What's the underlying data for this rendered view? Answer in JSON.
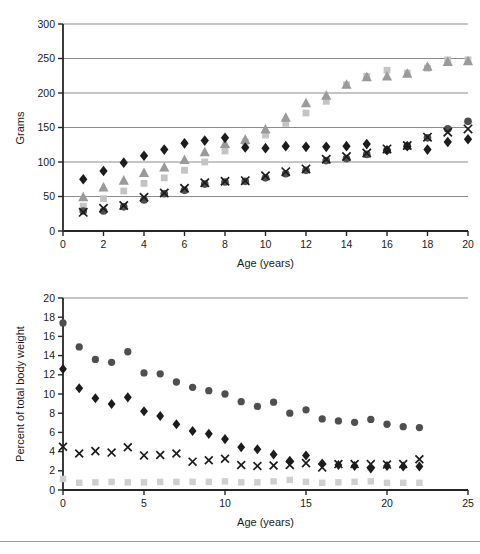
{
  "figure": {
    "background": "#ffffff",
    "width": 480,
    "height": 554,
    "grid_color": "#8c8c8c",
    "axis_color": "#262626",
    "text_color": "#1a1a1a"
  },
  "labels": {
    "top_ylabel": "Grams",
    "top_xlabel": "Age (years)",
    "bottom_ylabel": "Percent of total body weight",
    "bottom_xlabel": "Age (years)"
  },
  "markers": {
    "diamond_black": "#1c1c1c",
    "circle_dark": "#4f4f4f",
    "x_black": "#1c1c1c",
    "triangle_grey": "#9a9a9a",
    "square_lightgrey": "#c4c4c4",
    "square_palegrey": "#cfcfcf"
  },
  "chart_data": [
    {
      "id": "top",
      "type": "scatter",
      "title": "",
      "xlabel": "Age (years)",
      "ylabel": "Grams",
      "xlim": [
        0,
        20
      ],
      "ylim": [
        0,
        300
      ],
      "xticks": [
        0,
        2,
        4,
        6,
        8,
        10,
        12,
        14,
        16,
        18,
        20
      ],
      "yticks": [
        0,
        50,
        100,
        150,
        200,
        250,
        300
      ],
      "grid": "horizontal",
      "legend": "none",
      "series": [
        {
          "name": "black-diamond",
          "marker": "diamond",
          "color": "#1c1c1c",
          "points": [
            [
              1,
              75
            ],
            [
              2,
              87
            ],
            [
              3,
              99
            ],
            [
              4,
              109
            ],
            [
              5,
              118
            ],
            [
              6,
              127
            ],
            [
              7,
              131
            ],
            [
              8,
              135
            ],
            [
              9,
              121
            ],
            [
              10,
              120
            ],
            [
              11,
              123
            ],
            [
              12,
              122
            ],
            [
              13,
              122
            ],
            [
              14,
              123
            ],
            [
              15,
              126
            ],
            [
              16,
              117
            ],
            [
              17,
              123
            ],
            [
              18,
              118
            ],
            [
              19,
              129
            ],
            [
              20,
              133
            ]
          ]
        },
        {
          "name": "grey-triangle",
          "marker": "triangle",
          "color": "#9a9a9a",
          "points": [
            [
              1,
              49
            ],
            [
              2,
              63
            ],
            [
              3,
              73
            ],
            [
              4,
              84
            ],
            [
              5,
              92
            ],
            [
              6,
              103
            ],
            [
              7,
              114
            ],
            [
              8,
              126
            ],
            [
              9,
              132
            ],
            [
              10,
              147
            ],
            [
              11,
              164
            ],
            [
              12,
              185
            ],
            [
              13,
              196
            ],
            [
              14,
              212
            ],
            [
              15,
              223
            ],
            [
              16,
              224
            ],
            [
              17,
              228
            ],
            [
              18,
              238
            ],
            [
              19,
              245
            ],
            [
              20,
              246
            ]
          ]
        },
        {
          "name": "lightgrey-square",
          "marker": "square",
          "color": "#c4c4c4",
          "points": [
            [
              1,
              36
            ],
            [
              2,
              47
            ],
            [
              3,
              58
            ],
            [
              4,
              69
            ],
            [
              5,
              77
            ],
            [
              6,
              88
            ],
            [
              7,
              100
            ],
            [
              8,
              116
            ],
            [
              9,
              129
            ],
            [
              10,
              139
            ],
            [
              11,
              156
            ],
            [
              12,
              171
            ],
            [
              13,
              188
            ],
            [
              14,
              212
            ],
            [
              15,
              224
            ],
            [
              16,
              233
            ],
            [
              17,
              229
            ],
            [
              18,
              236
            ],
            [
              19,
              248
            ],
            [
              20,
              248
            ]
          ]
        },
        {
          "name": "dark-circle",
          "marker": "circle",
          "color": "#4f4f4f",
          "points": [
            [
              1,
              29
            ],
            [
              2,
              29
            ],
            [
              3,
              35
            ],
            [
              4,
              45
            ],
            [
              5,
              54
            ],
            [
              6,
              59
            ],
            [
              7,
              68
            ],
            [
              8,
              71
            ],
            [
              9,
              72
            ],
            [
              10,
              77
            ],
            [
              11,
              83
            ],
            [
              12,
              88
            ],
            [
              13,
              102
            ],
            [
              14,
              105
            ],
            [
              15,
              111
            ],
            [
              16,
              117
            ],
            [
              17,
              123
            ],
            [
              18,
              135
            ],
            [
              19,
              148
            ],
            [
              20,
              159
            ]
          ]
        },
        {
          "name": "black-x",
          "marker": "x",
          "color": "#1c1c1c",
          "points": [
            [
              1,
              27
            ],
            [
              2,
              33
            ],
            [
              3,
              37
            ],
            [
              4,
              49
            ],
            [
              5,
              55
            ],
            [
              6,
              62
            ],
            [
              7,
              70
            ],
            [
              8,
              72
            ],
            [
              9,
              73
            ],
            [
              10,
              80
            ],
            [
              11,
              86
            ],
            [
              12,
              90
            ],
            [
              13,
              104
            ],
            [
              14,
              108
            ],
            [
              15,
              113
            ],
            [
              16,
              119
            ],
            [
              17,
              124
            ],
            [
              18,
              136
            ],
            [
              19,
              143
            ],
            [
              20,
              148
            ]
          ]
        }
      ]
    },
    {
      "id": "bottom",
      "type": "scatter",
      "title": "",
      "xlabel": "Age (years)",
      "ylabel": "Percent of total body weight",
      "xlim": [
        0,
        25
      ],
      "ylim": [
        0,
        20
      ],
      "xticks": [
        0,
        5,
        10,
        15,
        20,
        25
      ],
      "yticks": [
        0,
        2,
        4,
        6,
        8,
        10,
        12,
        14,
        16,
        18,
        20
      ],
      "grid": "top-only",
      "legend": "none",
      "series": [
        {
          "name": "dark-circle",
          "marker": "circle",
          "color": "#4f4f4f",
          "points": [
            [
              0,
              17.4
            ],
            [
              1,
              14.9
            ],
            [
              2,
              13.6
            ],
            [
              3,
              13.3
            ],
            [
              4,
              14.4
            ],
            [
              5,
              12.2
            ],
            [
              6,
              12.1
            ],
            [
              7,
              11.25
            ],
            [
              8,
              10.7
            ],
            [
              9,
              10.35
            ],
            [
              10,
              10.0
            ],
            [
              11,
              9.2
            ],
            [
              12,
              8.7
            ],
            [
              13,
              9.15
            ],
            [
              14,
              8.0
            ],
            [
              15,
              8.35
            ],
            [
              16,
              7.4
            ],
            [
              17,
              7.2
            ],
            [
              18,
              7.05
            ],
            [
              19,
              7.35
            ],
            [
              20,
              6.85
            ],
            [
              21,
              6.6
            ],
            [
              22,
              6.5
            ]
          ]
        },
        {
          "name": "black-diamond",
          "marker": "diamond",
          "color": "#1c1c1c",
          "points": [
            [
              0,
              12.6
            ],
            [
              1,
              10.6
            ],
            [
              2,
              9.55
            ],
            [
              3,
              8.95
            ],
            [
              4,
              9.65
            ],
            [
              5,
              8.2
            ],
            [
              6,
              7.7
            ],
            [
              7,
              6.85
            ],
            [
              8,
              6.15
            ],
            [
              9,
              5.85
            ],
            [
              10,
              5.3
            ],
            [
              11,
              4.45
            ],
            [
              12,
              4.25
            ],
            [
              13,
              3.7
            ],
            [
              14,
              3.05
            ],
            [
              15,
              3.6
            ],
            [
              16,
              2.75
            ],
            [
              17,
              2.6
            ],
            [
              18,
              2.5
            ],
            [
              19,
              2.25
            ],
            [
              20,
              2.5
            ],
            [
              21,
              2.45
            ],
            [
              22,
              2.45
            ]
          ]
        },
        {
          "name": "black-x",
          "marker": "x",
          "color": "#1c1c1c",
          "points": [
            [
              0,
              4.5
            ],
            [
              1,
              3.8
            ],
            [
              2,
              4.05
            ],
            [
              3,
              3.9
            ],
            [
              4,
              4.45
            ],
            [
              5,
              3.6
            ],
            [
              6,
              3.65
            ],
            [
              7,
              3.8
            ],
            [
              8,
              2.95
            ],
            [
              9,
              3.1
            ],
            [
              10,
              3.25
            ],
            [
              11,
              2.6
            ],
            [
              12,
              2.5
            ],
            [
              13,
              2.55
            ],
            [
              14,
              2.6
            ],
            [
              15,
              2.8
            ],
            [
              16,
              2.35
            ],
            [
              17,
              2.7
            ],
            [
              18,
              2.7
            ],
            [
              19,
              2.7
            ],
            [
              20,
              2.65
            ],
            [
              21,
              2.7
            ],
            [
              22,
              3.2
            ]
          ]
        },
        {
          "name": "palegrey-square",
          "marker": "square",
          "color": "#cfcfcf",
          "points": [
            [
              0,
              1.15
            ],
            [
              1,
              0.75
            ],
            [
              2,
              0.8
            ],
            [
              3,
              0.85
            ],
            [
              4,
              0.8
            ],
            [
              5,
              0.8
            ],
            [
              6,
              0.85
            ],
            [
              7,
              0.85
            ],
            [
              8,
              0.85
            ],
            [
              9,
              0.85
            ],
            [
              10,
              0.9
            ],
            [
              11,
              0.8
            ],
            [
              12,
              0.8
            ],
            [
              13,
              0.9
            ],
            [
              14,
              1.05
            ],
            [
              15,
              0.85
            ],
            [
              16,
              0.75
            ],
            [
              17,
              0.8
            ],
            [
              18,
              0.85
            ],
            [
              19,
              0.9
            ],
            [
              20,
              0.75
            ],
            [
              21,
              0.75
            ],
            [
              22,
              0.75
            ]
          ]
        }
      ]
    }
  ]
}
